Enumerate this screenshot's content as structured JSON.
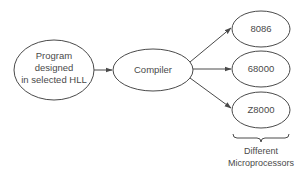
{
  "diagram": {
    "type": "flowchart",
    "source_node": {
      "lines": [
        "Program",
        "designed",
        "in selected HLL"
      ]
    },
    "compiler_node": {
      "label": "Compiler"
    },
    "target_nodes": [
      {
        "label": "8086"
      },
      {
        "label": "68000"
      },
      {
        "label": "Z8000"
      }
    ],
    "brace_caption": {
      "lines": [
        "Different",
        "Microprocessors"
      ]
    },
    "edges": [
      {
        "from": "Program designed in selected HLL",
        "to": "Compiler"
      },
      {
        "from": "Compiler",
        "to": "8086"
      },
      {
        "from": "Compiler",
        "to": "68000"
      },
      {
        "from": "Compiler",
        "to": "Z8000"
      }
    ],
    "colors": {
      "stroke": "#4a4a4a",
      "background": "#ffffff"
    }
  }
}
